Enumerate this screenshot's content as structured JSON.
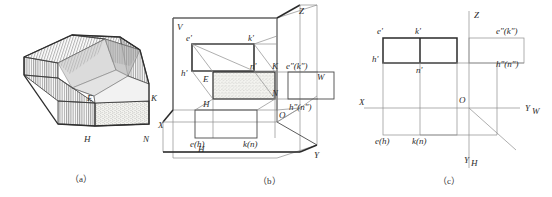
{
  "figure": {
    "captions": [
      {
        "id": "a",
        "text": "（a）"
      },
      {
        "id": "b",
        "text": "（b）"
      },
      {
        "id": "c",
        "text": "（c）"
      }
    ]
  },
  "panel_a": {
    "name": "isometric-solid",
    "labels": [
      {
        "key": "E",
        "text": "E"
      },
      {
        "key": "K",
        "text": "K"
      },
      {
        "key": "H",
        "text": "H"
      },
      {
        "key": "N",
        "text": "N"
      }
    ]
  },
  "panel_b": {
    "name": "projection-box",
    "axis_labels": [
      {
        "key": "V",
        "text": "V"
      },
      {
        "key": "Z",
        "text": "Z"
      },
      {
        "key": "X",
        "text": "X"
      },
      {
        "key": "Y",
        "text": "Y"
      },
      {
        "key": "W",
        "text": "W"
      },
      {
        "key": "H",
        "text": "H"
      },
      {
        "key": "O",
        "text": "O"
      }
    ],
    "point_labels": [
      {
        "key": "e_prime",
        "text": "e'"
      },
      {
        "key": "k_prime",
        "text": "k'"
      },
      {
        "key": "h_prime",
        "text": "h'"
      },
      {
        "key": "n_prime",
        "text": "n'"
      },
      {
        "key": "E",
        "text": "E"
      },
      {
        "key": "K",
        "text": "K"
      },
      {
        "key": "H",
        "text": "H"
      },
      {
        "key": "N",
        "text": "N"
      },
      {
        "key": "e_dd_k_dd",
        "text": "e\"(k\")"
      },
      {
        "key": "h_dd_n_dd",
        "text": "h\"(n\")"
      },
      {
        "key": "e_h",
        "text": "e(h)"
      },
      {
        "key": "k_n",
        "text": "k(n)"
      }
    ]
  },
  "panel_c": {
    "name": "unfolded-three-views",
    "axis_labels": [
      {
        "key": "Z",
        "text": "Z"
      },
      {
        "key": "X",
        "text": "X"
      },
      {
        "key": "O",
        "text": "O"
      },
      {
        "key": "YW",
        "text": "Y",
        "sub": "W"
      },
      {
        "key": "YH",
        "text": "Y",
        "sub": "H"
      }
    ],
    "point_labels": [
      {
        "key": "e_prime",
        "text": "e'"
      },
      {
        "key": "k_prime",
        "text": "k'"
      },
      {
        "key": "h_prime",
        "text": "h'"
      },
      {
        "key": "n_prime",
        "text": "n'"
      },
      {
        "key": "e_dd_k_dd",
        "text": "e\"(k\")"
      },
      {
        "key": "h_dd_n_dd",
        "text": "h\"(n\")"
      },
      {
        "key": "e_h",
        "text": "e(h)"
      },
      {
        "key": "k_n",
        "text": "k(n)"
      }
    ]
  },
  "colors": {
    "line_thin": "#8d8d8d",
    "line_medium": "#4a4a4a",
    "line_thick": "#2a2a2a",
    "text": "#2b2b2b",
    "background": "#ffffff"
  }
}
